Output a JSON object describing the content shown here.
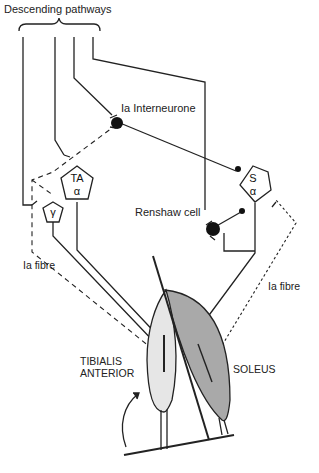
{
  "title": "Descending pathways",
  "labels": {
    "ia_interneurone": "Ia Interneurone",
    "renshaw_cell": "Renshaw cell",
    "ia_fibre_left": "Ia fibre",
    "ia_fibre_right": "Ia fibre",
    "tibialis_line1": "TIBIALIS",
    "tibialis_line2": "ANTERIOR",
    "soleus": "SOLEUS"
  },
  "cells": {
    "ta_alpha": {
      "top": "TA",
      "bottom": "α"
    },
    "s_alpha": {
      "top": "S",
      "bottom": "α"
    },
    "gamma": {
      "top": "γ"
    }
  },
  "colors": {
    "line": "#222222",
    "tibialis_fill": "#e6e6e6",
    "soleus_fill": "#a9a9a9"
  }
}
